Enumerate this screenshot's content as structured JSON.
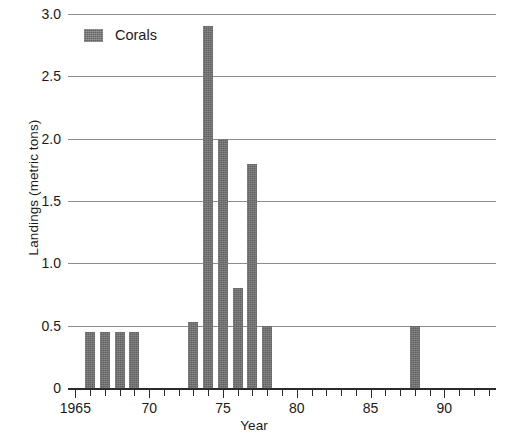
{
  "chart_data": {
    "type": "bar",
    "title": "",
    "subtitle": "",
    "xlabel": "Year",
    "ylabel": "Landings (metric tons)",
    "xlim": [
      1964.5,
      1993.5
    ],
    "ylim": [
      0,
      3.0
    ],
    "grid": true,
    "legend_position": "top-left",
    "y_ticks": [
      "0",
      "0.5",
      "1.0",
      "1.5",
      "2.0",
      "2.5",
      "3.0"
    ],
    "y_tick_values": [
      0,
      0.5,
      1.0,
      1.5,
      2.0,
      2.5,
      3.0
    ],
    "x_tick_values": [
      1965,
      1966,
      1967,
      1968,
      1969,
      1970,
      1971,
      1972,
      1973,
      1974,
      1975,
      1976,
      1977,
      1978,
      1979,
      1980,
      1981,
      1982,
      1983,
      1984,
      1985,
      1986,
      1987,
      1988,
      1989,
      1990,
      1991,
      1992,
      1993
    ],
    "x_major_ticks": [
      1965,
      1970,
      1975,
      1980,
      1985,
      1990
    ],
    "x_tick_labels": [
      "1965",
      "70",
      "75",
      "80",
      "85",
      "90"
    ],
    "series": [
      {
        "name": "Corals",
        "color": "#6e6e6e",
        "categories": [
          1965,
          1966,
          1967,
          1968,
          1969,
          1970,
          1971,
          1972,
          1973,
          1974,
          1975,
          1976,
          1977,
          1978,
          1979,
          1980,
          1981,
          1982,
          1983,
          1984,
          1985,
          1986,
          1987,
          1988,
          1989,
          1990,
          1991,
          1992,
          1993
        ],
        "values": [
          0,
          0.45,
          0.45,
          0.45,
          0.45,
          0,
          0,
          0,
          0.53,
          2.9,
          2.0,
          0.8,
          1.8,
          0.5,
          0,
          0,
          0,
          0,
          0,
          0,
          0,
          0,
          0,
          0.5,
          0,
          0,
          0,
          0,
          0
        ]
      }
    ]
  },
  "legend": {
    "entries": [
      {
        "label": "Corals",
        "color": "#6e6e6e"
      }
    ]
  },
  "axes": {
    "y_title": "Landings (metric tons)",
    "x_title": "Year"
  },
  "colors": {
    "bar": "#6e6e6e",
    "gridline": "#8c8c8c",
    "axis": "#2b2b2b",
    "text": "#1a1a1a",
    "background": "#ffffff"
  }
}
